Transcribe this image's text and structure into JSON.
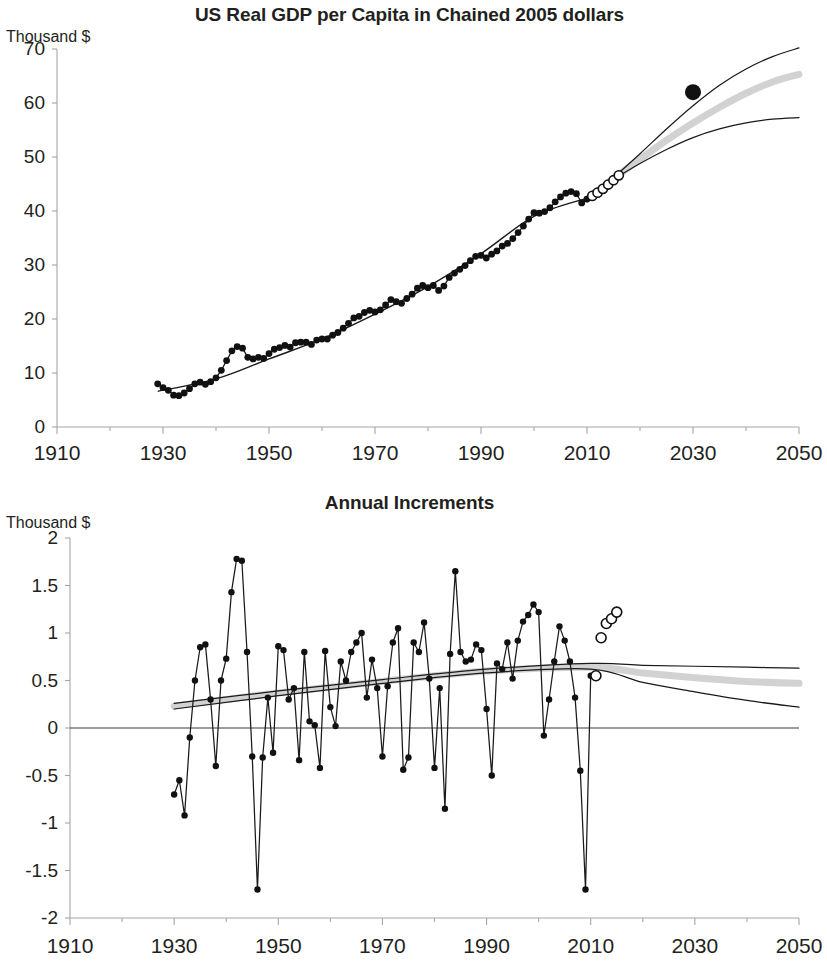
{
  "figure": {
    "width": 819,
    "height": 976,
    "background": "#ffffff",
    "ink_color": "#111111",
    "axis_color": "#a6a6a6",
    "projection_band_color": "#d2d2d2"
  },
  "panels": {
    "top": {
      "title": "US Real GDP per Capita in Chained 2005 dollars",
      "unit_label": "Thousand $",
      "ylabels": [
        "70",
        "60",
        "50",
        "40",
        "30",
        "20",
        "10",
        "0"
      ],
      "xlabels": [
        "1910",
        "1930",
        "1950",
        "1970",
        "1990",
        "2010",
        "2030",
        "2050"
      ]
    },
    "bottom": {
      "title": "Annual Increments",
      "unit_label": "Thousand $",
      "ylabels": [
        "2",
        "1.5",
        "1",
        "0.5",
        "0",
        "-0.5",
        "-1",
        "-1.5",
        "-2"
      ],
      "xlabels": [
        "1910",
        "1930",
        "1950",
        "1970",
        "1990",
        "2010",
        "2030",
        "2050"
      ]
    }
  },
  "chart_data": [
    {
      "id": "us-real-gdp-per-capita",
      "type": "line",
      "title": "US Real GDP per Capita in Chained 2005 dollars",
      "xlabel": "",
      "ylabel": "Thousand $",
      "xlim": [
        1910,
        2050
      ],
      "ylim": [
        0,
        70
      ],
      "ytick_step": 10,
      "xtick_step": 20,
      "xtick_minor_step": 10,
      "grid": false,
      "legend": null,
      "series": [
        {
          "name": "Historical real GDP per capita",
          "marker": "filled-circle",
          "x": [
            1929,
            1930,
            1931,
            1932,
            1933,
            1934,
            1935,
            1936,
            1937,
            1938,
            1939,
            1940,
            1941,
            1942,
            1943,
            1944,
            1945,
            1946,
            1947,
            1948,
            1949,
            1950,
            1951,
            1952,
            1953,
            1954,
            1955,
            1956,
            1957,
            1958,
            1959,
            1960,
            1961,
            1962,
            1963,
            1964,
            1965,
            1966,
            1967,
            1968,
            1969,
            1970,
            1971,
            1972,
            1973,
            1974,
            1975,
            1976,
            1977,
            1978,
            1979,
            1980,
            1981,
            1982,
            1983,
            1984,
            1985,
            1986,
            1987,
            1988,
            1989,
            1990,
            1991,
            1992,
            1993,
            1994,
            1995,
            1996,
            1997,
            1998,
            1999,
            2000,
            2001,
            2002,
            2003,
            2004,
            2005,
            2006,
            2007,
            2008,
            2009,
            2010
          ],
          "y": [
            8.0,
            7.3,
            6.8,
            5.9,
            5.8,
            6.3,
            7.1,
            8.0,
            8.3,
            7.9,
            8.4,
            9.1,
            10.5,
            12.3,
            14.1,
            14.9,
            14.6,
            12.9,
            12.6,
            12.9,
            12.7,
            13.6,
            14.4,
            14.7,
            15.1,
            14.8,
            15.6,
            15.7,
            15.7,
            15.3,
            16.1,
            16.3,
            16.3,
            17.0,
            17.5,
            18.3,
            19.2,
            20.2,
            20.5,
            21.2,
            21.6,
            21.3,
            21.7,
            22.6,
            23.6,
            23.2,
            22.9,
            23.8,
            24.6,
            25.7,
            26.2,
            25.8,
            26.2,
            25.3,
            26.1,
            27.7,
            28.5,
            29.2,
            29.9,
            30.8,
            31.6,
            31.8,
            31.3,
            32.0,
            32.6,
            33.5,
            34.0,
            34.9,
            36.0,
            37.2,
            38.5,
            39.7,
            39.6,
            39.9,
            40.6,
            41.7,
            42.6,
            43.3,
            43.6,
            43.2,
            41.5,
            42.2
          ],
          "note": "Depression trough 1933 (~5.8), WWII peak 1944 (~14.9), 2009 recession dip (~41.5)"
        },
        {
          "name": "Near-term forecast",
          "marker": "hollow-circle",
          "x": [
            2011,
            2012,
            2013,
            2014,
            2015,
            2016
          ],
          "y": [
            42.8,
            43.4,
            44.1,
            44.9,
            45.7,
            46.6
          ]
        },
        {
          "name": "Central projection (gray band)",
          "marker": "none",
          "style": "thick-gray",
          "x": [
            2010,
            2015,
            2020,
            2025,
            2030,
            2035,
            2040,
            2045,
            2050
          ],
          "y": [
            42.2,
            46.0,
            49.6,
            53.1,
            56.3,
            59.2,
            61.8,
            63.9,
            65.3
          ]
        },
        {
          "name": "Upper projection bound",
          "marker": "none",
          "style": "thin-black",
          "x": [
            2010,
            2015,
            2020,
            2025,
            2030,
            2035,
            2040,
            2045,
            2050
          ],
          "y": [
            42.2,
            46.2,
            50.6,
            55.2,
            59.5,
            63.3,
            66.3,
            68.6,
            70.2
          ]
        },
        {
          "name": "Lower projection bound",
          "marker": "none",
          "style": "thin-black",
          "x": [
            2010,
            2015,
            2020,
            2025,
            2030,
            2035,
            2040,
            2045,
            2050
          ],
          "y": [
            42.2,
            45.8,
            48.8,
            51.4,
            53.6,
            55.2,
            56.3,
            57.0,
            57.3
          ]
        },
        {
          "name": "Fitted trend through history",
          "marker": "none",
          "style": "thin-black",
          "x": [
            1929,
            1940,
            1950,
            1960,
            1970,
            1980,
            1990,
            2000,
            2010
          ],
          "y": [
            6.6,
            8.9,
            12.6,
            16.3,
            20.9,
            26.0,
            32.1,
            39.0,
            42.4
          ]
        },
        {
          "name": "Outlier reference point",
          "marker": "large-filled-circle",
          "x": [
            2030
          ],
          "y": [
            62.0
          ]
        }
      ]
    },
    {
      "id": "annual-increments",
      "type": "line",
      "title": "Annual Increments",
      "xlabel": "",
      "ylabel": "Thousand $",
      "xlim": [
        1910,
        2050
      ],
      "ylim": [
        -2,
        2
      ],
      "ytick_step": 0.5,
      "xtick_step": 20,
      "xtick_minor_step": 10,
      "grid": false,
      "zero_line": true,
      "legend": null,
      "series": [
        {
          "name": "Annual increment (historical)",
          "marker": "filled-circle",
          "x": [
            1930,
            1931,
            1932,
            1933,
            1934,
            1935,
            1936,
            1937,
            1938,
            1939,
            1940,
            1941,
            1942,
            1943,
            1944,
            1945,
            1946,
            1947,
            1948,
            1949,
            1950,
            1951,
            1952,
            1953,
            1954,
            1955,
            1956,
            1957,
            1958,
            1959,
            1960,
            1961,
            1962,
            1963,
            1964,
            1965,
            1966,
            1967,
            1968,
            1969,
            1970,
            1971,
            1972,
            1973,
            1974,
            1975,
            1976,
            1977,
            1978,
            1979,
            1980,
            1981,
            1982,
            1983,
            1984,
            1985,
            1986,
            1987,
            1988,
            1989,
            1990,
            1991,
            1992,
            1993,
            1994,
            1995,
            1996,
            1997,
            1998,
            1999,
            2000,
            2001,
            2002,
            2003,
            2004,
            2005,
            2006,
            2007,
            2008,
            2009,
            2010
          ],
          "y": [
            -0.7,
            -0.55,
            -0.92,
            -0.1,
            0.5,
            0.85,
            0.88,
            0.3,
            -0.4,
            0.5,
            0.73,
            1.43,
            1.78,
            1.76,
            0.8,
            -0.3,
            -1.7,
            -0.31,
            0.32,
            -0.26,
            0.86,
            0.82,
            0.3,
            0.42,
            -0.34,
            0.8,
            0.07,
            0.03,
            -0.42,
            0.81,
            0.22,
            0.02,
            0.7,
            0.5,
            0.8,
            0.9,
            1.0,
            0.32,
            0.72,
            0.42,
            -0.3,
            0.44,
            0.9,
            1.05,
            -0.44,
            -0.31,
            0.9,
            0.8,
            1.11,
            0.52,
            -0.42,
            0.42,
            -0.85,
            0.78,
            1.65,
            0.8,
            0.7,
            0.72,
            0.88,
            0.82,
            0.2,
            -0.5,
            0.68,
            0.62,
            0.9,
            0.52,
            0.92,
            1.12,
            1.19,
            1.3,
            1.22,
            -0.08,
            0.3,
            0.7,
            1.07,
            0.92,
            0.7,
            0.32,
            -0.45,
            -1.7,
            0.55
          ],
          "note": "Peaks 1942 (1.78) and 1984 (1.65); troughs 1946 and 2009 (-1.70)"
        },
        {
          "name": "Near-term forecast increments",
          "marker": "hollow-circle",
          "x": [
            2011,
            2012,
            2013,
            2014,
            2015
          ],
          "y": [
            0.55,
            0.95,
            1.1,
            1.15,
            1.22
          ]
        },
        {
          "name": "Central projection (gray band)",
          "marker": "none",
          "style": "thick-gray",
          "x": [
            1930,
            1950,
            1970,
            1990,
            2010,
            2020,
            2030,
            2040,
            2050
          ],
          "y": [
            0.23,
            0.37,
            0.49,
            0.6,
            0.64,
            0.58,
            0.53,
            0.49,
            0.47
          ]
        },
        {
          "name": "Upper projection bound",
          "marker": "none",
          "style": "thin-black",
          "x": [
            1930,
            1950,
            1970,
            1990,
            2010,
            2020,
            2030,
            2040,
            2050
          ],
          "y": [
            0.26,
            0.39,
            0.51,
            0.62,
            0.68,
            0.66,
            0.65,
            0.64,
            0.63
          ]
        },
        {
          "name": "Lower projection bound",
          "marker": "none",
          "style": "thin-black",
          "x": [
            1930,
            1950,
            1970,
            1990,
            2010,
            2020,
            2030,
            2040,
            2050
          ],
          "y": [
            0.2,
            0.34,
            0.47,
            0.58,
            0.62,
            0.48,
            0.38,
            0.29,
            0.22
          ]
        }
      ]
    }
  ]
}
